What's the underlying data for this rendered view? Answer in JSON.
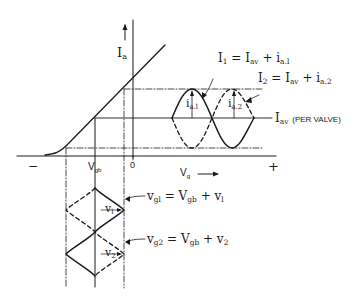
{
  "figure": {
    "y_axis_label": "I",
    "y_axis_label_sub": "a",
    "x_axis_label": "V",
    "x_axis_label_sub": "g",
    "x_axis_arrow": "→",
    "minus_sign": "−",
    "plus_sign": "+",
    "zero_tick": "0",
    "vgb_tick": "V",
    "vgb_tick_sub": "gb",
    "eq_i1": {
      "lhs": "I",
      "lhs_sub": "1",
      "rhs": " = I",
      "rhs_sub1": "av",
      "plus": " + i",
      "rhs_sub2": "a.l"
    },
    "eq_i2": {
      "lhs": "I",
      "lhs_sub": "2",
      "rhs": " = I",
      "rhs_sub1": "av",
      "plus": " + i",
      "rhs_sub2": "a.2"
    },
    "iav_label": {
      "text": "I",
      "sub": "av",
      "note": "(PER VALVE)"
    },
    "ia1_label": {
      "text": "i",
      "sub": "a.l"
    },
    "ia2_label": {
      "text": "i",
      "sub": "a.2"
    },
    "v1_label": {
      "text": "v",
      "sub": "l"
    },
    "v2_label": {
      "text": "v",
      "sub": "2"
    },
    "eq_vg1": {
      "lhs": "v",
      "lhs_sub": "gl",
      "rhs": " = V",
      "rhs_sub": "gb",
      "plus": " + v",
      "plus_sub": "l"
    },
    "eq_vg2": {
      "lhs": "v",
      "lhs_sub": "g2",
      "rhs": " = V",
      "rhs_sub": "gb",
      "plus": " + v",
      "plus_sub": "2"
    },
    "caption": ""
  },
  "colors": {
    "ink": "#1a1a1a",
    "background": "#ffffff"
  }
}
